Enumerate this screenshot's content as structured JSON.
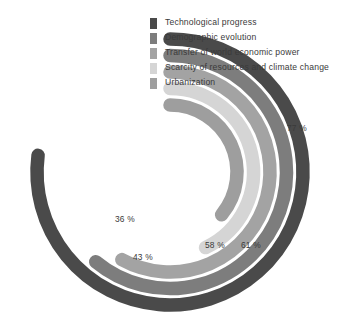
{
  "chart_data": {
    "type": "bar",
    "subtype": "radial-bar",
    "title": "",
    "subtitle": "",
    "xlabel": "",
    "ylabel": "",
    "categories": [
      "Technological progress",
      "Demographic evolution",
      "Transfer of world economic power",
      "Scarcity of resources and climate change",
      "Urbanization"
    ],
    "values": [
      77,
      61,
      58,
      43,
      36
    ],
    "value_labels": [
      "77 %",
      "61 %",
      "58 %",
      "43 %",
      "36 %"
    ],
    "unit": "%",
    "ylim": [
      0,
      100
    ],
    "grid": false,
    "legend_position": "inside-top-right",
    "start_angle_deg": 0,
    "direction": "clockwise",
    "colors": [
      "#4a4a4a",
      "#7d7d7d",
      "#a3a3a3",
      "#d5d5d5",
      "#9e9e9e"
    ],
    "series": [
      {
        "name": "Technological progress",
        "value": 77,
        "label": "77 %",
        "color": "#4a4a4a",
        "ring": 1
      },
      {
        "name": "Demographic evolution",
        "value": 61,
        "label": "61 %",
        "color": "#7d7d7d",
        "ring": 2
      },
      {
        "name": "Transfer of world economic power",
        "value": 58,
        "label": "58 %",
        "color": "#a3a3a3",
        "ring": 3
      },
      {
        "name": "Scarcity of resources and climate change",
        "value": 43,
        "label": "43 %",
        "color": "#d5d5d5",
        "ring": 4
      },
      {
        "name": "Urbanization",
        "value": 36,
        "label": "36 %",
        "color": "#9e9e9e",
        "ring": 5
      }
    ]
  },
  "legend": {
    "items": [
      {
        "label": "Technological progress",
        "color": "#4a4a4a"
      },
      {
        "label": "Demographic evolution",
        "color": "#7d7d7d"
      },
      {
        "label": "Transfer of world economic power",
        "color": "#a3a3a3"
      },
      {
        "label": "Scarcity of resources and climate change",
        "color": "#d5d5d5"
      },
      {
        "label": "Urbanization",
        "color": "#9e9e9e"
      }
    ]
  },
  "value_annotations": [
    {
      "text": "77 %",
      "for": "Technological progress"
    },
    {
      "text": "61 %",
      "for": "Demographic evolution"
    },
    {
      "text": "58 %",
      "for": "Transfer of world economic power"
    },
    {
      "text": "43 %",
      "for": "Scarcity of resources and climate change"
    },
    {
      "text": "36 %",
      "for": "Urbanization"
    }
  ],
  "background_color": "#ffffff"
}
